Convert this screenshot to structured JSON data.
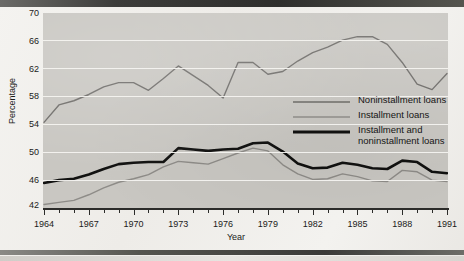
{
  "chart_data": {
    "type": "line",
    "title": "",
    "xlabel": "Year",
    "ylabel": "Percentage",
    "xlim": [
      1964,
      1991
    ],
    "ylim": [
      42,
      70
    ],
    "yticks": [
      42,
      46,
      50,
      54,
      58,
      62,
      66,
      70
    ],
    "xticks": [
      1964,
      1967,
      1970,
      1973,
      1976,
      1979,
      1982,
      1985,
      1988,
      1991
    ],
    "xtick_all_years": [
      1964,
      1965,
      1966,
      1967,
      1968,
      1969,
      1970,
      1971,
      1972,
      1973,
      1974,
      1975,
      1976,
      1977,
      1978,
      1979,
      1980,
      1981,
      1982,
      1983,
      1984,
      1985,
      1986,
      1987,
      1988,
      1989,
      1990,
      1991
    ],
    "grid": "horizontal-white",
    "legend_position": "inside-right-middle",
    "x": [
      1964,
      1965,
      1966,
      1967,
      1968,
      1969,
      1970,
      1971,
      1972,
      1973,
      1974,
      1975,
      1976,
      1977,
      1978,
      1979,
      1980,
      1981,
      1982,
      1983,
      1984,
      1985,
      1986,
      1987,
      1988,
      1989,
      1990,
      1991
    ],
    "series": [
      {
        "name": "Noninstallment loans",
        "color": "#6e6c69",
        "width": 1.4,
        "values": [
          54.3,
          56.8,
          57.4,
          58.3,
          59.4,
          60.0,
          60.0,
          58.9,
          60.6,
          62.4,
          61.0,
          59.6,
          57.8,
          62.9,
          62.9,
          61.2,
          61.6,
          63.1,
          64.3,
          65.1,
          66.1,
          66.6,
          66.6,
          65.5,
          62.9,
          59.8,
          59.0,
          61.3
        ]
      },
      {
        "name": "Installment loans",
        "color": "#8e8c88",
        "width": 1.4,
        "values": [
          42.5,
          42.8,
          43.1,
          43.9,
          44.9,
          45.7,
          46.2,
          46.8,
          47.9,
          48.7,
          48.5,
          48.3,
          49.1,
          49.9,
          50.6,
          50.2,
          48.2,
          46.9,
          46.1,
          46.2,
          46.9,
          46.5,
          45.9,
          45.8,
          47.4,
          47.2,
          46.0,
          45.8
        ]
      },
      {
        "name": "Installment and noninstallment loans",
        "color": "#111110",
        "width": 2.6,
        "values": [
          45.6,
          46.0,
          46.2,
          46.8,
          47.6,
          48.3,
          48.5,
          48.6,
          48.6,
          50.6,
          50.4,
          50.2,
          50.4,
          50.5,
          51.3,
          51.4,
          50.1,
          48.4,
          47.7,
          47.8,
          48.5,
          48.2,
          47.7,
          47.6,
          48.8,
          48.6,
          47.2,
          47.0
        ]
      }
    ]
  },
  "axes": {
    "y_title": "Percentage",
    "x_title": "Year",
    "y_tick_labels": [
      "70",
      "66",
      "62",
      "58",
      "54",
      "50",
      "46",
      "42"
    ],
    "x_tick_labels": [
      "1964",
      "1967",
      "1970",
      "1973",
      "1976",
      "1979",
      "1982",
      "1985",
      "1988",
      "1991"
    ]
  },
  "legend": {
    "items": [
      {
        "label": "Noninstallment loans",
        "label2": "",
        "style": "thin-gray"
      },
      {
        "label": "Installment loans",
        "label2": "",
        "style": "thin-lightgray"
      },
      {
        "label": "Installment and",
        "label2": "noninstallment loans",
        "style": "thick-black"
      }
    ]
  },
  "colors": {
    "plot_background": "#c9c7c2",
    "gridline": "#f4f3f0",
    "axis": "#2c2c2a",
    "page": "#f2f1ee"
  }
}
